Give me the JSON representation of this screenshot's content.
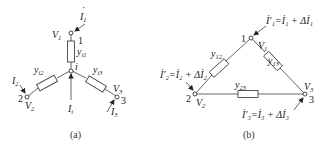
{
  "colors": {
    "line": "#555555",
    "text": "#222222",
    "background": "#ffffff"
  },
  "figure_a": {
    "caption": "(a)",
    "center_node": {
      "label": "i"
    },
    "nodes": [
      {
        "id": "1",
        "label": "1",
        "voltage": "V",
        "voltage_sub": "1",
        "current": "I",
        "current_sub": "1"
      },
      {
        "id": "2",
        "label": "2",
        "voltage": "V",
        "voltage_sub": "2",
        "current": "I",
        "current_sub": "2"
      },
      {
        "id": "3",
        "label": "3",
        "voltage": "V",
        "voltage_sub": "3",
        "current": "I",
        "current_sub": "3"
      }
    ],
    "admittances": [
      {
        "label": "y",
        "sub": "i1"
      },
      {
        "label": "y",
        "sub": "i2"
      },
      {
        "label": "y",
        "sub": "i3"
      }
    ],
    "injected_current": {
      "label": "I",
      "sub": "i"
    }
  },
  "figure_b": {
    "caption": "(b)",
    "nodes": [
      {
        "id": "1",
        "label": "1",
        "voltage": "V",
        "voltage_sub": "1",
        "current_eq": "İ′₁=İ₁ + Δİ₁"
      },
      {
        "id": "2",
        "label": "2",
        "voltage": "V",
        "voltage_sub": "2",
        "current_eq": "İ′₂=İ₂ + Δİ₂"
      },
      {
        "id": "3",
        "label": "3",
        "voltage": "V",
        "voltage_sub": "3",
        "current_eq": "İ′₃=İ₃ + Δİ₃"
      }
    ],
    "admittances": [
      {
        "label": "y",
        "sub": "12"
      },
      {
        "label": "y",
        "sub": "13"
      },
      {
        "label": "y",
        "sub": "23"
      }
    ]
  }
}
